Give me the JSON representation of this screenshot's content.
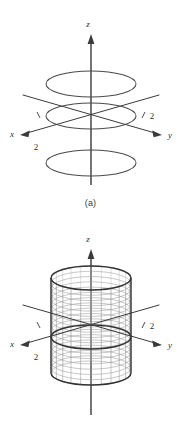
{
  "figure": {
    "background_color": "#ffffff",
    "line_color": "#3a3a3a",
    "mesh_color": "#9a9a9a",
    "panels": [
      {
        "id": "a",
        "caption": "(a)",
        "description": "Three horizontal circles (traces) centered on the z-axis of a 3D coordinate system",
        "axes": {
          "z_label": "z",
          "x_label": "x",
          "y_label": "y",
          "x_tick_label": "2",
          "y_tick_label": "2"
        },
        "traces": [
          {
            "name": "upper-circle",
            "radius": 2,
            "height": "above"
          },
          {
            "name": "middle-circle",
            "radius": 2,
            "height": "z = 0"
          },
          {
            "name": "lower-circle",
            "radius": 2,
            "height": "below"
          }
        ]
      },
      {
        "id": "b",
        "caption": "(b)",
        "description": "Mesh wireframe of the circular cylinder of radius 2 about the z-axis",
        "axes": {
          "z_label": "z",
          "x_label": "x",
          "y_label": "y",
          "x_tick_label": "2",
          "y_tick_label": "2"
        },
        "surface": {
          "name": "cylinder",
          "radius": 2,
          "mesh_columns": 24,
          "mesh_rows": 18
        }
      }
    ]
  },
  "chart_data": {
    "type": "line",
    "xlabel": "x",
    "ylabel": "y",
    "zlabel": "z",
    "panels": [
      {
        "label": "(a)",
        "kind": "traces",
        "series": [
          {
            "name": "trace-upper",
            "radius": 2,
            "z": 2.2
          },
          {
            "name": "trace-middle",
            "radius": 2,
            "z": 0
          },
          {
            "name": "trace-lower",
            "radius": 2,
            "z": -2.2
          }
        ],
        "tick_values": {
          "x": 2,
          "y": 2
        }
      },
      {
        "label": "(b)",
        "kind": "surface",
        "surface": {
          "equation": "x^2 + y^2 = 4",
          "radius": 2,
          "z_range": [
            -2.6,
            2.6
          ]
        },
        "tick_values": {
          "x": 2,
          "y": 2
        }
      }
    ],
    "grid": false,
    "legend": "none"
  }
}
